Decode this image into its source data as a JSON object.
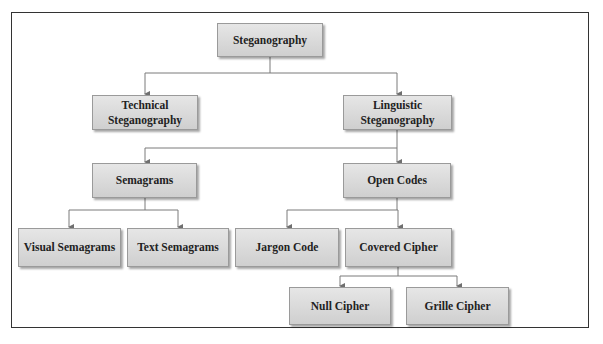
{
  "diagram": {
    "type": "hierarchy-tree",
    "title_fragment": "g                                                  g p",
    "line_color": "#7a7a7a",
    "node_fill": "#d9d9d9",
    "nodes": {
      "root": "Steganography",
      "technical": "Technical Steganography",
      "linguistic": "Linguistic Steganography",
      "semagrams": "Semagrams",
      "open_codes": "Open Codes",
      "visual_semagrams": "Visual Semagrams",
      "text_semagrams": "Text Semagrams",
      "jargon_code": "Jargon Code",
      "covered_cipher": "Covered Cipher",
      "null_cipher": "Null Cipher",
      "grille_cipher": "Grille Cipher"
    },
    "labels": {
      "technical_l1": "Technical",
      "technical_l2": "Steganography",
      "linguistic_l1": "Linguistic",
      "linguistic_l2": "Steganography"
    },
    "edges": [
      [
        "Steganography",
        "Technical Steganography"
      ],
      [
        "Steganography",
        "Linguistic Steganography"
      ],
      [
        "Linguistic Steganography",
        "Semagrams"
      ],
      [
        "Linguistic Steganography",
        "Open Codes"
      ],
      [
        "Semagrams",
        "Visual Semagrams"
      ],
      [
        "Semagrams",
        "Text Semagrams"
      ],
      [
        "Open Codes",
        "Jargon Code"
      ],
      [
        "Open Codes",
        "Covered Cipher"
      ],
      [
        "Covered Cipher",
        "Null Cipher"
      ],
      [
        "Covered Cipher",
        "Grille Cipher"
      ]
    ]
  }
}
